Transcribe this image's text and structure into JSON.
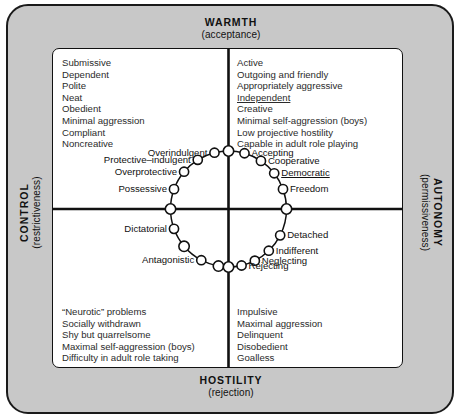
{
  "axes": {
    "top": {
      "main": "WARMTH",
      "sub": "(acceptance)"
    },
    "bottom": {
      "main": "HOSTILITY",
      "sub": "(rejection)"
    },
    "left": {
      "main": "CONTROL",
      "sub": "(restrictiveness)"
    },
    "right": {
      "main": "AUTONOMY",
      "sub": "(permissiveness)"
    }
  },
  "quadrants": {
    "top_left": {
      "name": "warmth-control",
      "traits": [
        "Submissive",
        "Dependent",
        "Polite",
        "Neat",
        "Obedient",
        "Minimal aggression",
        "Compliant",
        "Noncreative"
      ]
    },
    "top_right": {
      "name": "warmth-autonomy",
      "traits": [
        "Active",
        "Outgoing and friendly",
        "Appropriately aggressive",
        "Independent",
        "Creative",
        "Minimal self-aggression (boys)",
        "Low projective hostility",
        "Capable in adult role playing"
      ],
      "underlined": [
        "Independent"
      ]
    },
    "bottom_left": {
      "name": "hostility-control",
      "traits": [
        "“Neurotic” problems",
        "Socially withdrawn",
        "Shy but quarrelsome",
        "Maximal self-aggression (boys)",
        "Difficulty in adult role taking"
      ]
    },
    "bottom_right": {
      "name": "hostility-autonomy",
      "traits": [
        "Impulsive",
        "Maximal aggression",
        "Delinquent",
        "Disobedient",
        "Goalless"
      ]
    }
  },
  "chart_data": {
    "type": "scatter",
    "title": "",
    "xlabel": "WARMTH (acceptance) – HOSTILITY (rejection)",
    "ylabel": "CONTROL (restrictiveness) – AUTONOMY (permissiveness)",
    "grid": false,
    "legend": "none",
    "ring": {
      "center": {
        "x": 175.5,
        "y": 160
      },
      "radius": 58,
      "node_count": 20
    },
    "nodes": [
      {
        "label": "",
        "angle_deg": 90,
        "side": "none",
        "labelled": false
      },
      {
        "label": "Overindulgent",
        "angle_deg": 104,
        "side": "left",
        "labelled": true
      },
      {
        "label": "Protective–indulgent",
        "angle_deg": 122,
        "side": "left",
        "labelled": true
      },
      {
        "label": "Overprotective",
        "angle_deg": 140,
        "side": "left",
        "labelled": true
      },
      {
        "label": "Possessive",
        "angle_deg": 160,
        "side": "left",
        "labelled": true
      },
      {
        "label": "",
        "angle_deg": 180,
        "side": "none",
        "labelled": false
      },
      {
        "label": "Dictatorial",
        "angle_deg": 200,
        "side": "left",
        "labelled": true
      },
      {
        "label": "",
        "angle_deg": 220,
        "side": "none",
        "labelled": false
      },
      {
        "label": "Antagonistic",
        "angle_deg": 242,
        "side": "left",
        "labelled": true
      },
      {
        "label": "",
        "angle_deg": 260,
        "side": "none",
        "labelled": false
      },
      {
        "label": "",
        "angle_deg": 270,
        "side": "none",
        "labelled": false
      },
      {
        "label": "Rejecting",
        "angle_deg": 283,
        "side": "right",
        "labelled": true
      },
      {
        "label": "Neglecting",
        "angle_deg": 297,
        "side": "right",
        "labelled": true
      },
      {
        "label": "Indifferent",
        "angle_deg": 314,
        "side": "right",
        "labelled": true
      },
      {
        "label": "Detached",
        "angle_deg": 333,
        "side": "right",
        "labelled": true
      },
      {
        "label": "",
        "angle_deg": 0,
        "side": "none",
        "labelled": false
      },
      {
        "label": "Freedom",
        "angle_deg": 20,
        "side": "right",
        "labelled": true
      },
      {
        "label": "Democratic",
        "angle_deg": 38,
        "side": "right",
        "labelled": true
      },
      {
        "label": "Cooperative",
        "angle_deg": 56,
        "side": "right",
        "labelled": true
      },
      {
        "label": "Accepting",
        "angle_deg": 74,
        "side": "right",
        "labelled": true
      }
    ],
    "underlined_nodes": [
      "Democratic"
    ]
  },
  "colors": {
    "plate_background": "#c8c8c8",
    "panel_background": "#ffffff",
    "line": "#111111",
    "trait_text": "#2b2b2b"
  }
}
